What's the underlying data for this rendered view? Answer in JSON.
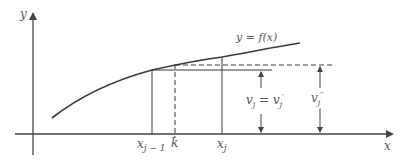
{
  "diagram": {
    "colors": {
      "line": "#3a3a3a",
      "axis": "#444444",
      "text": "#555555",
      "background": "#ffffff"
    },
    "axes": {
      "y_label": "y",
      "x_label": "x"
    },
    "curve": {
      "label": "y = f(x)"
    },
    "x_ticks": [
      {
        "id": "x_j_minus_1",
        "label": "x",
        "sub": "j − 1"
      },
      {
        "id": "k",
        "label": "k"
      },
      {
        "id": "x_j",
        "label": "x",
        "sub": "j"
      }
    ],
    "dimensions": [
      {
        "id": "v_j",
        "label": "v",
        "sub": "j",
        "eq": " = ",
        "label2": "v",
        "sub2": "j",
        "sup2": "′"
      },
      {
        "id": "v_j_double_prime",
        "label": "v",
        "sub": "j",
        "sup": "″"
      }
    ]
  }
}
